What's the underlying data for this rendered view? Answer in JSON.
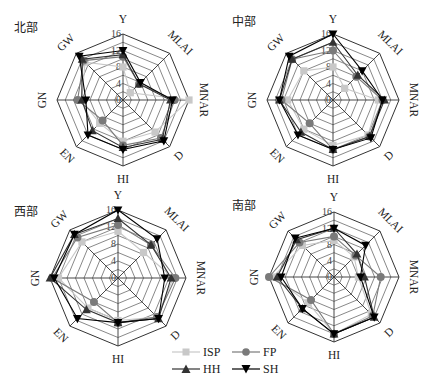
{
  "chart_data": [
    {
      "type": "radar",
      "title": "北部",
      "axes": [
        "Y",
        "MLAI",
        "MNAR",
        "D",
        "HI",
        "EN",
        "GN",
        "GW"
      ],
      "ticks": [
        0,
        4,
        8,
        12,
        16
      ],
      "range": [
        0,
        16
      ],
      "series": [
        {
          "name": "ISP",
          "values": [
            8,
            2.5,
            16,
            11,
            10,
            8,
            10,
            13
          ]
        },
        {
          "name": "FP",
          "values": [
            10.5,
            5.5,
            12.5,
            13,
            11,
            7,
            11,
            13.5
          ]
        },
        {
          "name": "HH",
          "values": [
            11,
            5.5,
            11.5,
            13.5,
            11.5,
            10.5,
            10,
            14
          ]
        },
        {
          "name": "SH",
          "values": [
            12,
            6,
            12,
            14,
            12,
            12,
            9,
            15
          ]
        }
      ]
    },
    {
      "type": "radar",
      "title": "中部",
      "axes": [
        "Y",
        "MLAI",
        "MNAR",
        "D",
        "HI",
        "EN",
        "GN",
        "GW"
      ],
      "ticks": [
        0,
        4,
        8,
        12,
        16
      ],
      "range": [
        0,
        16
      ],
      "series": [
        {
          "name": "ISP",
          "values": [
            8,
            4,
            11,
            12,
            11,
            10,
            11,
            10
          ]
        },
        {
          "name": "FP",
          "values": [
            12,
            8,
            12,
            12.5,
            12,
            8,
            12.5,
            14
          ]
        },
        {
          "name": "HH",
          "values": [
            14,
            8.5,
            12.5,
            12.5,
            12,
            11,
            13,
            14
          ]
        },
        {
          "name": "SH",
          "values": [
            16,
            10,
            12,
            13,
            12,
            12,
            13,
            15
          ]
        }
      ]
    },
    {
      "type": "radar",
      "title": "西部",
      "axes": [
        "Y",
        "MLAI",
        "MNAR",
        "D",
        "HI",
        "EN",
        "GN",
        "GW"
      ],
      "ticks": [
        0,
        4,
        8,
        12,
        16
      ],
      "range": [
        0,
        16
      ],
      "series": [
        {
          "name": "ISP",
          "values": [
            11,
            8.5,
            13,
            13,
            10,
            10,
            14,
            12
          ]
        },
        {
          "name": "FP",
          "values": [
            12.5,
            11,
            13.5,
            13,
            10.5,
            8,
            15.5,
            13.5
          ]
        },
        {
          "name": "HH",
          "values": [
            14,
            11,
            12.5,
            13.5,
            10.5,
            10.5,
            16,
            14.5
          ]
        },
        {
          "name": "SH",
          "values": [
            16,
            13,
            11,
            13.5,
            10.5,
            13.5,
            15,
            14.5
          ]
        }
      ]
    },
    {
      "type": "radar",
      "title": "南部",
      "axes": [
        "Y",
        "MLAI",
        "MNAR",
        "D",
        "HI",
        "EN",
        "GN",
        "GW"
      ],
      "ticks": [
        0,
        4,
        8,
        12,
        16
      ],
      "range": [
        0,
        16
      ],
      "series": [
        {
          "name": "ISP",
          "values": [
            9,
            7,
            6,
            13,
            14,
            9,
            15,
            11
          ]
        },
        {
          "name": "FP",
          "values": [
            10,
            7.5,
            11.5,
            13.5,
            14,
            8,
            16,
            12
          ]
        },
        {
          "name": "HH",
          "values": [
            12,
            8,
            7.5,
            14,
            14,
            11,
            14,
            13
          ]
        },
        {
          "name": "SH",
          "values": [
            12,
            11,
            6.5,
            14,
            14,
            11,
            13,
            13.5
          ]
        }
      ]
    }
  ],
  "legend": {
    "position": "bottom-center",
    "items": [
      {
        "name": "ISP",
        "marker": "square",
        "color": "#c8c8c8"
      },
      {
        "name": "FP",
        "marker": "circle",
        "color": "#7a7a7a"
      },
      {
        "name": "HH",
        "marker": "triangle-up",
        "color": "#333333"
      },
      {
        "name": "SH",
        "marker": "triangle-down",
        "color": "#000000"
      }
    ]
  },
  "layout": {
    "panels": [
      {
        "cx": 123,
        "cy": 100,
        "r": 66,
        "title_x": 14,
        "title_y": 32
      },
      {
        "cx": 333,
        "cy": 100,
        "r": 66,
        "title_x": 232,
        "title_y": 26
      },
      {
        "cx": 118,
        "cy": 278,
        "r": 68,
        "title_x": 14,
        "title_y": 216
      },
      {
        "cx": 334,
        "cy": 277,
        "r": 65,
        "title_x": 232,
        "title_y": 210
      }
    ]
  }
}
